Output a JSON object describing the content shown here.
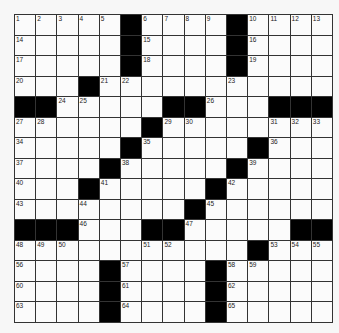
{
  "puzzle": {
    "rows": 15,
    "cols": 15,
    "grid": [
      [
        1,
        2,
        3,
        4,
        5,
        "#",
        6,
        7,
        8,
        9,
        "#",
        10,
        11,
        12,
        13
      ],
      [
        14,
        0,
        0,
        0,
        0,
        "#",
        15,
        0,
        0,
        0,
        "#",
        16,
        0,
        0,
        0
      ],
      [
        17,
        0,
        0,
        0,
        0,
        "#",
        18,
        0,
        0,
        0,
        "#",
        19,
        0,
        0,
        0
      ],
      [
        20,
        0,
        0,
        "#",
        21,
        22,
        0,
        0,
        0,
        0,
        23,
        0,
        0,
        0,
        0
      ],
      [
        "#",
        "#",
        24,
        25,
        0,
        0,
        0,
        "#",
        "#",
        26,
        0,
        0,
        "#",
        "#",
        "#"
      ],
      [
        27,
        28,
        0,
        0,
        0,
        0,
        "#",
        29,
        30,
        0,
        0,
        0,
        31,
        32,
        33
      ],
      [
        34,
        0,
        0,
        0,
        0,
        "#",
        35,
        0,
        0,
        0,
        0,
        "#",
        36,
        0,
        0
      ],
      [
        37,
        0,
        0,
        0,
        "#",
        38,
        0,
        0,
        0,
        0,
        "#",
        39,
        0,
        0,
        0
      ],
      [
        40,
        0,
        0,
        "#",
        41,
        0,
        0,
        0,
        0,
        "#",
        42,
        0,
        0,
        0,
        0
      ],
      [
        43,
        0,
        0,
        44,
        0,
        0,
        0,
        0,
        "#",
        45,
        0,
        0,
        0,
        0,
        0
      ],
      [
        "#",
        "#",
        "#",
        46,
        0,
        0,
        "#",
        "#",
        47,
        0,
        0,
        0,
        0,
        "#",
        "#"
      ],
      [
        48,
        49,
        50,
        0,
        0,
        0,
        51,
        52,
        0,
        0,
        0,
        "#",
        53,
        54,
        55
      ],
      [
        56,
        0,
        0,
        0,
        "#",
        57,
        0,
        0,
        0,
        "#",
        58,
        59,
        0,
        0,
        0
      ],
      [
        60,
        0,
        0,
        0,
        "#",
        61,
        0,
        0,
        0,
        "#",
        62,
        0,
        0,
        0,
        0
      ],
      [
        63,
        0,
        0,
        0,
        "#",
        64,
        0,
        0,
        0,
        "#",
        65,
        0,
        0,
        0,
        0
      ]
    ]
  },
  "colors": {
    "block": "#000000",
    "cell": "#fbfbfb",
    "line": "#333333",
    "background": "#f7f7f7"
  }
}
